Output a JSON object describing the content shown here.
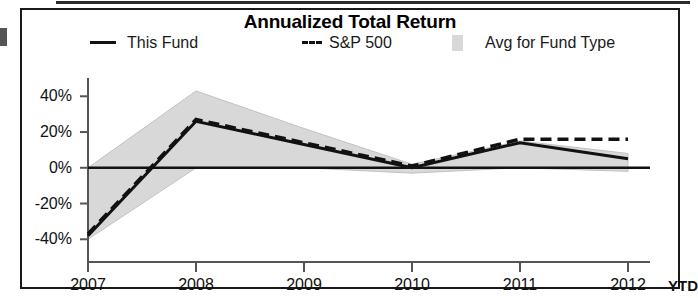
{
  "chart_data": {
    "type": "line",
    "title": "Annualized Total Return",
    "xlabel": "",
    "ylabel": "",
    "x": [
      "2007",
      "2008",
      "2009",
      "2010",
      "2011",
      "2012"
    ],
    "xtick_labels": [
      "2007",
      "2008",
      "2009",
      "2010",
      "2011",
      "2012"
    ],
    "xtick_suffix": "YTD",
    "ytick_labels": [
      "40%",
      "20%",
      "0%",
      "-20%",
      "-40%"
    ],
    "ytick_values": [
      40,
      20,
      0,
      -20,
      -40
    ],
    "ylim": [
      -46,
      48
    ],
    "grid": false,
    "legend_position": "top",
    "series": [
      {
        "name": "This Fund",
        "style": "solid",
        "color": "#111111",
        "values": [
          -38,
          26,
          13,
          0,
          14,
          5
        ]
      },
      {
        "name": "S&P 500",
        "style": "dashed",
        "color": "#111111",
        "values": [
          -37,
          27,
          14,
          1,
          16,
          16
        ]
      },
      {
        "name": "Avg for Fund Type",
        "style": "band",
        "color": "#d8d8d8",
        "band_upper": [
          0,
          43,
          22,
          2,
          15,
          8
        ],
        "band_lower": [
          -40,
          0,
          0,
          -3,
          0,
          -2
        ]
      }
    ],
    "legend": [
      {
        "label": "This Fund",
        "marker": "solid-line"
      },
      {
        "label": "S&P 500",
        "marker": "dashed-line"
      },
      {
        "label": "Avg for Fund Type",
        "marker": "gray-square"
      }
    ],
    "colors": {
      "line": "#111111",
      "band_fill": "#d8d8d8",
      "axis": "#555555",
      "frame": "#1a1a1a"
    }
  }
}
